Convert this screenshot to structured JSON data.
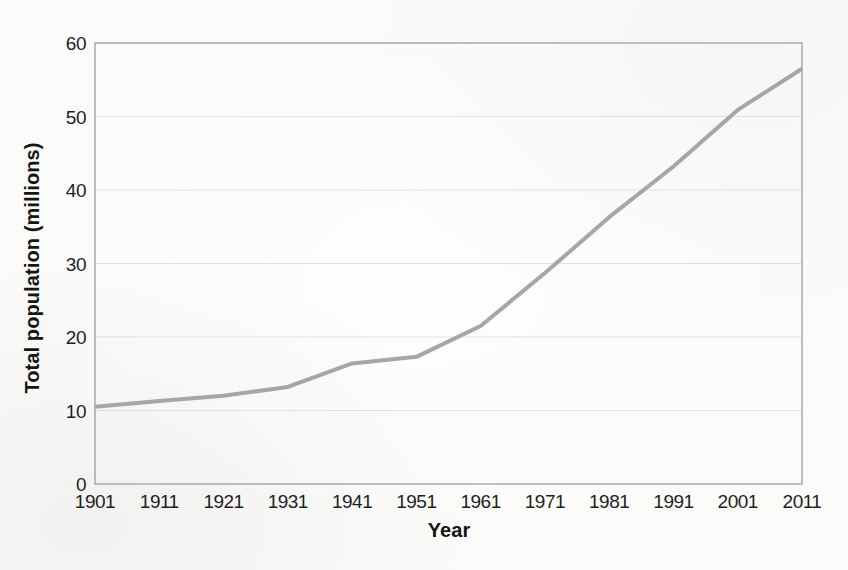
{
  "chart_data": {
    "type": "line",
    "title": "",
    "xlabel": "Year",
    "ylabel": "Total population (millions)",
    "x": [
      1901,
      1911,
      1921,
      1931,
      1941,
      1951,
      1961,
      1971,
      1981,
      1991,
      2001,
      2011
    ],
    "values": [
      10.5,
      11.3,
      12.0,
      13.2,
      16.4,
      17.3,
      21.5,
      28.7,
      36.3,
      43.2,
      50.9,
      56.5
    ],
    "ylim": [
      0,
      60
    ],
    "yticks": [
      0,
      10,
      20,
      30,
      40,
      50,
      60
    ],
    "grid": "horizontal",
    "legend": "none",
    "line_color": "#a6a6a6",
    "line_width": 4,
    "gridline_color": "#e1e1e0",
    "axis_color": "#a9a9a9",
    "tick_text_color": "#1f1f1f",
    "title_text_color": "#151515",
    "background_color": "#fbfbf9"
  },
  "layout": {
    "plot_left": 95,
    "plot_right": 802,
    "plot_top": 43,
    "plot_bottom": 484
  }
}
